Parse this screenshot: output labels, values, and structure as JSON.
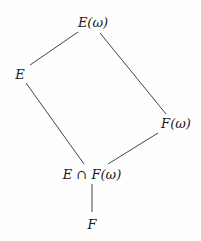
{
  "diagram": {
    "type": "lattice",
    "nodes": [
      {
        "id": "Ew",
        "label": "E(ω)",
        "x": 93,
        "y": 22
      },
      {
        "id": "E",
        "label": "E",
        "x": 20,
        "y": 74
      },
      {
        "id": "Fw",
        "label": "F(ω)",
        "x": 176,
        "y": 123
      },
      {
        "id": "EcapFw",
        "label": "E ∩ F(ω)",
        "x": 92,
        "y": 174
      },
      {
        "id": "F",
        "label": "F",
        "x": 92,
        "y": 224
      }
    ],
    "edges": [
      {
        "from": "Ew",
        "to": "E"
      },
      {
        "from": "Ew",
        "to": "Fw"
      },
      {
        "from": "E",
        "to": "EcapFw"
      },
      {
        "from": "Fw",
        "to": "EcapFw"
      },
      {
        "from": "EcapFw",
        "to": "F"
      }
    ],
    "line_color": "#444444"
  }
}
